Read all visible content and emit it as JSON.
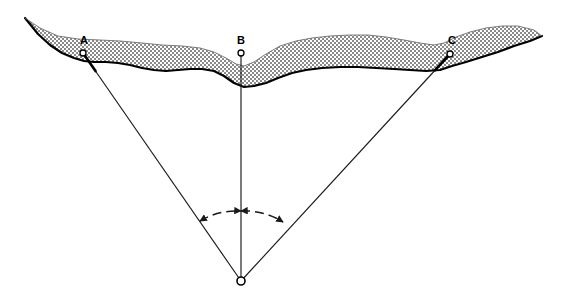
{
  "figure": {
    "background_color": "#ffffff",
    "width": 564,
    "height": 306,
    "line_color": "#1a1a1a",
    "terrain_fill": "#c9c9c9",
    "terrain_outline_color": "#000000"
  },
  "stations": [
    {
      "id": "station-a",
      "label": "A",
      "label_x": 84,
      "label_y": 44,
      "marker_x": 83,
      "marker_y": 53,
      "marker_shape": "circle",
      "marker_radius": 3.0
    },
    {
      "id": "station-b",
      "label": "B",
      "label_x": 241,
      "label_y": 44,
      "marker_x": 241,
      "marker_y": 53,
      "marker_shape": "circle",
      "marker_radius": 3.0
    },
    {
      "id": "station-c",
      "label": "C",
      "label_x": 452,
      "label_y": 44,
      "marker_x": 450,
      "marker_y": 54,
      "marker_shape": "circle",
      "marker_radius": 3.0
    }
  ],
  "focus": {
    "id": "focus-point",
    "label": "",
    "x": 241,
    "y": 281,
    "marker_shape": "circle",
    "marker_radius": 4.0
  },
  "rays": [
    {
      "id": "ray-a",
      "from": "A",
      "to": "focus",
      "x1": 83,
      "y1": 53,
      "x2": 241,
      "y2": 281
    },
    {
      "id": "ray-b",
      "from": "B",
      "to": "focus",
      "x1": 241,
      "y1": 53,
      "x2": 241,
      "y2": 281
    },
    {
      "id": "ray-c",
      "from": "C",
      "to": "focus",
      "x1": 450,
      "y1": 54,
      "x2": 241,
      "y2": 281
    }
  ],
  "angle_arcs": [
    {
      "id": "angle-arc-ab",
      "between": "A-B",
      "path": "M 200 221 A 72 72 0 0 1 241 211",
      "arrow_start": "outward-left",
      "arrow_end": "inward-center"
    },
    {
      "id": "angle-arc-bc",
      "between": "B-C",
      "path": "M 241 211 A 72 72 0 0 1 283 222",
      "arrow_start": "inward-center",
      "arrow_end": "outward-right"
    }
  ],
  "terrain": {
    "id": "terrain-band",
    "description": "stippled surface layer band spanning the full width",
    "top_path": "M 25 18 L 40 28 L 58 36 L 78 39 L 100 40 L 120 41 L 142 43 L 162 45 L 182 46 L 200 48 L 214 52 L 226 58 L 236 64 L 244 66 L 254 62 L 266 54 L 280 46 L 296 41 L 312 38 L 330 36 L 350 35 L 368 35 L 386 37 L 404 40 L 420 43 L 434 45 L 444 43 L 456 37 L 470 32 L 486 28 L 502 26 L 518 26 L 534 30 L 542 36",
    "bottom_path": "M 542 36 L 530 41 L 514 46 L 498 52 L 482 57 L 466 62 L 452 66 L 440 70 L 426 71 L 410 70 L 394 69 L 376 68 L 358 67 L 340 67 L 322 68 L 306 70 L 292 73 L 278 78 L 266 83 L 254 86 L 244 87 L 234 83 L 224 76 L 214 71 L 202 69 L 190 69 L 178 70 L 166 71 L 154 70 L 142 68 L 130 65 L 118 63 L 106 62 L 94 62 L 84 61 L 74 58 L 62 53 L 50 45 L 38 34 L 25 18"
  }
}
